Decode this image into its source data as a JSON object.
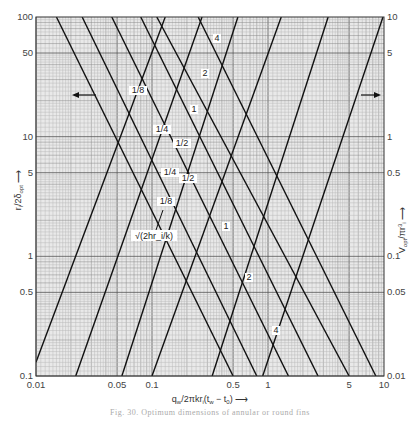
{
  "chart_data": {
    "type": "line",
    "title": "",
    "caption": "Fig. 30. Optimum dimensions of annular or round fins",
    "xlabel": "q_w / 2πkr_i(t_w - t_0)",
    "ylabel_left": "r_i / 2δ_opt",
    "ylabel_right": "V_opt / πr_i³",
    "x_scale": "log",
    "y_scale": "log",
    "xlim": [
      0.01,
      10
    ],
    "ylim_left": [
      0.1,
      100
    ],
    "ylim_right": [
      0.01,
      10
    ],
    "grid": true,
    "x_ticks": [
      "0.01",
      "0.05",
      "0.1",
      "0.5",
      "1",
      "5",
      "10"
    ],
    "y_left_ticks": [
      "100",
      "50",
      "10",
      "5",
      "1",
      "0.5",
      "0.1"
    ],
    "y_right_ticks": [
      "10",
      "5",
      "1",
      "0.5",
      "0.1",
      "0.05",
      "0.01"
    ],
    "parameter": "r_e / r_i (curve labels)",
    "annotations": [
      "√(2hr_i/k)",
      "← (left axis curves)",
      "→ (right axis curves)"
    ],
    "series_left_axis_descending": [
      {
        "name": "1/8",
        "points": [
          [
            0.015,
            100
          ],
          [
            0.5,
            0.1
          ]
        ]
      },
      {
        "name": "1/4",
        "points": [
          [
            0.025,
            100
          ],
          [
            0.8,
            0.1
          ]
        ]
      },
      {
        "name": "1/2",
        "points": [
          [
            0.045,
            100
          ],
          [
            1.5,
            0.1
          ]
        ]
      },
      {
        "name": "1",
        "points": [
          [
            0.08,
            100
          ],
          [
            2.7,
            0.1
          ]
        ]
      },
      {
        "name": "2",
        "points": [
          [
            0.11,
            100
          ],
          [
            5.0,
            0.1
          ]
        ]
      },
      {
        "name": "4",
        "points": [
          [
            0.25,
            100
          ],
          [
            8.5,
            0.1
          ]
        ]
      }
    ],
    "series_right_axis_ascending": [
      {
        "name": "√(2hr_i/k) = 1/8",
        "points": [
          [
            0.01,
            0.013
          ],
          [
            0.13,
            10
          ]
        ]
      },
      {
        "name": "√(2hr_i/k) = 1/4",
        "points": [
          [
            0.022,
            0.01
          ],
          [
            0.27,
            10
          ]
        ]
      },
      {
        "name": "√(2hr_i/k) = 1/2",
        "points": [
          [
            0.055,
            0.01
          ],
          [
            0.55,
            10
          ]
        ]
      },
      {
        "name": "√(2hr_i/k) = 1",
        "points": [
          [
            0.1,
            0.01
          ],
          [
            1.3,
            10
          ]
        ]
      },
      {
        "name": "√(2hr_i/k) = 2",
        "points": [
          [
            0.33,
            0.01
          ],
          [
            3.3,
            10
          ]
        ]
      },
      {
        "name": "√(2hr_i/k) = 4",
        "points": [
          [
            0.9,
            0.01
          ],
          [
            9.8,
            10
          ]
        ]
      }
    ]
  },
  "figure": {
    "arrow_left_label": "←",
    "arrow_right_label": "→"
  }
}
